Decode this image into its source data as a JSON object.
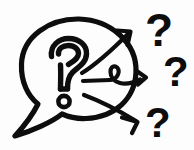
{
  "image": {
    "title": "Questions spreading illustration",
    "alt_text": "A speech bubble with a question mark inside, with three arrows pointing right toward three question marks",
    "background_color": "#fdfdfd",
    "ink_color": "#0d0d0d",
    "width": 194,
    "height": 150
  },
  "elements": {
    "speech_bubble": {
      "name": "speech bubble",
      "shape": "rounded bubble with pointed tail at lower left",
      "center_x": 78,
      "center_y": 72,
      "radius_x": 57,
      "radius_y": 54,
      "stroke_width": 5
    },
    "bubble_question_mark": {
      "name": "question mark inside bubble",
      "glyph": "?",
      "style": "outlined hand drawn with hollow round dot",
      "x": 64,
      "y": 72,
      "size": 62
    },
    "arrows": [
      {
        "name": "top arrow",
        "direction": "up-right",
        "start_x": 84,
        "start_y": 72,
        "end_x": 131,
        "end_y": 31,
        "has_loop": false,
        "stroke_width": 4
      },
      {
        "name": "middle arrow",
        "direction": "right",
        "start_x": 84,
        "start_y": 80,
        "end_x": 148,
        "end_y": 76,
        "has_loop": true,
        "loop_label": "curl knot",
        "stroke_width": 4
      },
      {
        "name": "bottom arrow",
        "direction": "down-right",
        "start_x": 86,
        "start_y": 96,
        "end_x": 139,
        "end_y": 122,
        "has_loop": false,
        "stroke_width": 4
      }
    ],
    "outer_question_marks": [
      {
        "name": "top question mark",
        "glyph": "?",
        "x": 145,
        "y": 12,
        "size": 44
      },
      {
        "name": "middle question mark",
        "glyph": "?",
        "x": 163,
        "y": 53,
        "size": 40
      },
      {
        "name": "bottom question mark",
        "glyph": "?",
        "x": 145,
        "y": 104,
        "size": 40
      }
    ]
  }
}
